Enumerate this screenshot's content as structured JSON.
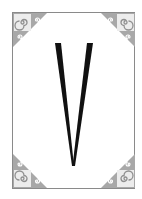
{
  "card": {
    "letter": "V",
    "colors": {
      "background": "#ffffff",
      "border": "#8a8a8a",
      "ornament": "#a8a8a8",
      "letter": "#111111"
    },
    "corners": [
      "top-left-ornament",
      "top-right-ornament",
      "bottom-left-ornament",
      "bottom-right-ornament"
    ]
  }
}
